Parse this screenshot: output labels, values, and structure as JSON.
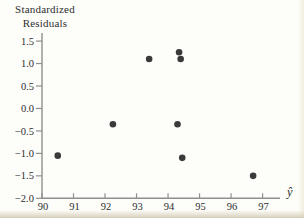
{
  "figure": {
    "background": "#fdfdfa"
  },
  "chart_data": {
    "type": "scatter",
    "title": "",
    "ylabel": "Standardized Residuals",
    "ylabel_lines": [
      "Standardized",
      "Residuals"
    ],
    "xlabel": "ŷ",
    "x_ticks": [
      90,
      91,
      92,
      93,
      94,
      95,
      96,
      97
    ],
    "x_tick_labels": [
      "90",
      "91",
      "92",
      "93",
      "94",
      "95",
      "96",
      "97"
    ],
    "y_ticks": [
      1.5,
      1.0,
      0.5,
      0.0,
      -0.5,
      -1.0,
      -1.5,
      -2.0
    ],
    "y_tick_labels": [
      "1.5",
      "1.0",
      "0.5",
      "0.0",
      "−0.5",
      "−1.0",
      "−1.5",
      "−2.0"
    ],
    "xlim": [
      90,
      97.6
    ],
    "ylim": [
      -2.0,
      1.68
    ],
    "grid": false,
    "legend": null,
    "points": [
      {
        "x": 90.5,
        "y": -1.05
      },
      {
        "x": 92.25,
        "y": -0.35
      },
      {
        "x": 93.4,
        "y": 1.1
      },
      {
        "x": 94.35,
        "y": 1.25
      },
      {
        "x": 94.4,
        "y": 1.1
      },
      {
        "x": 94.3,
        "y": -0.35
      },
      {
        "x": 94.45,
        "y": -1.1
      },
      {
        "x": 96.7,
        "y": -1.5
      }
    ],
    "point_color": "#3a3a3a",
    "axis_color": "#8f8f8f",
    "text_color": "#2e2e2e"
  }
}
